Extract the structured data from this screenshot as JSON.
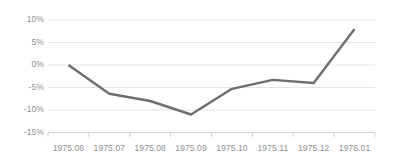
{
  "chart_data": {
    "type": "line",
    "title": "",
    "xlabel": "",
    "ylabel": "",
    "categories": [
      "1975.06",
      "1975.07",
      "1975.08",
      "1975.09",
      "1975.10",
      "1975.11",
      "1975.12",
      "1976.01"
    ],
    "values": [
      0,
      -6.4,
      -8,
      -11,
      -5.3,
      -3.3,
      -4,
      8
    ],
    "ylim": [
      -15,
      10
    ],
    "yticks": [
      10,
      5,
      0,
      -5,
      -10,
      -15
    ],
    "ytick_labels": [
      "10%",
      "5%",
      "0%",
      "-5%",
      "-10%",
      "-15%"
    ],
    "grid": true,
    "legend": "none",
    "series": [
      {
        "name": "series-1",
        "values": [
          0,
          -6.4,
          -8,
          -11,
          -5.3,
          -3.3,
          -4,
          8
        ],
        "color": "#6e6e6e"
      }
    ],
    "colors": {
      "line": "#6e6e6e",
      "gridline": "#e4e4e4",
      "axis": "#d0d0d0",
      "tick_text": "#8f8f8f",
      "background": "#ffffff"
    }
  }
}
